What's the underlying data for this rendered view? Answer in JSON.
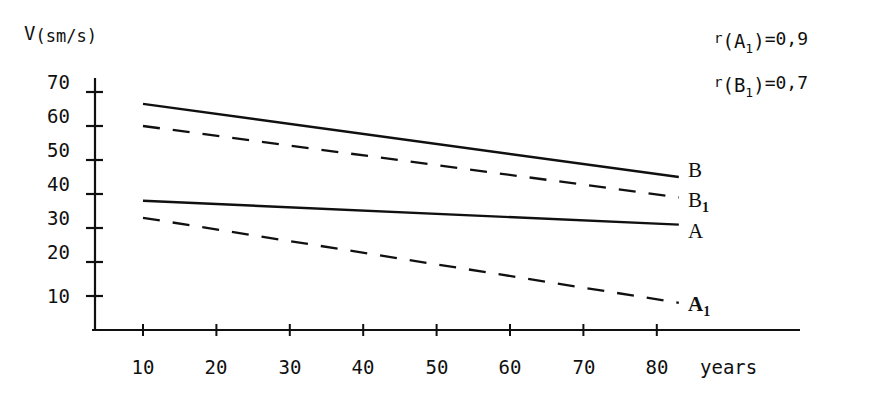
{
  "chart_data": {
    "type": "line",
    "title": "",
    "xlabel": "years",
    "ylabel": "V(sm/s)",
    "ylabel_parts": {
      "symbol": "V",
      "units": "(sm/s)"
    },
    "xlim": [
      0,
      90
    ],
    "ylim": [
      0,
      75
    ],
    "x_ticks": [
      10,
      20,
      30,
      40,
      50,
      60,
      70,
      80
    ],
    "x_tick_labels": [
      "10",
      "20",
      "30",
      "40",
      "50",
      "60",
      "70",
      "80"
    ],
    "y_ticks": [
      10,
      20,
      30,
      40,
      50,
      60,
      70
    ],
    "y_tick_labels": [
      "10",
      "20",
      "30",
      "40",
      "50",
      "60",
      "70"
    ],
    "grid": false,
    "legend_position": "right-inline",
    "x": [
      10,
      83
    ],
    "series": [
      {
        "name": "B",
        "label": "B",
        "style": "solid",
        "color": "#101010",
        "values": [
          66.5,
          45.0
        ],
        "label_value": 45.0
      },
      {
        "name": "B1",
        "label": "B",
        "label_subscript": "1",
        "style": "dashed",
        "color": "#101010",
        "values": [
          60.0,
          39.0
        ],
        "label_value": 39.0
      },
      {
        "name": "A",
        "label": "A",
        "style": "solid",
        "color": "#101010",
        "values": [
          38.0,
          31.0
        ],
        "label_value": 31.0
      },
      {
        "name": "A1",
        "label": "A",
        "label_subscript": "1",
        "style": "dashed",
        "color": "#101010",
        "values": [
          33.0,
          8.0
        ],
        "label_value": 8.0
      }
    ],
    "annotations": [
      {
        "name": "r-A1",
        "lead": "r",
        "open_paren": "(",
        "base": "A",
        "subscript": "1",
        "close_paren": ")",
        "equals": "=",
        "value": "0,9",
        "text": "r(A1)=0,9"
      },
      {
        "name": "r-B1",
        "lead": "r",
        "open_paren": "(",
        "base": "B",
        "subscript": "1",
        "close_paren": ")",
        "equals": "=",
        "value": "0,7",
        "text": "r(B1)=0,7"
      }
    ]
  },
  "colors": {
    "ink": "#101010",
    "background": "#ffffff"
  }
}
